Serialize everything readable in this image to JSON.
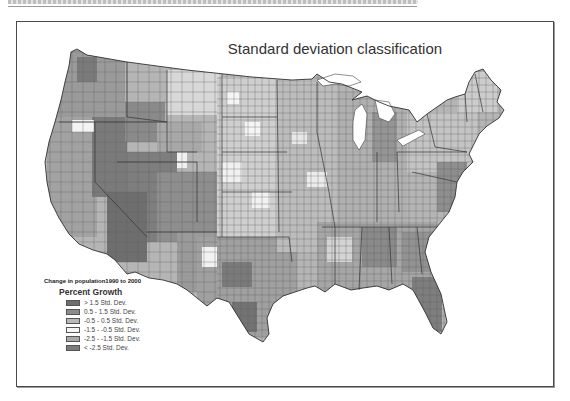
{
  "page": {
    "top_caption": "",
    "map_title": "Standard deviation classification"
  },
  "legend": {
    "caption": "Change in population1990 to 2000",
    "heading": "Percent Growth",
    "items": [
      {
        "label": "> 1.5 Std. Dev.",
        "color": "#6e6e6e"
      },
      {
        "label": "0.5 - 1.5 Std. Dev.",
        "color": "#8c8c8c"
      },
      {
        "label": "-0.5 - 0.5 Std. Dev.",
        "color": "#b9b9b9"
      },
      {
        "label": "-1.5 - -0.5 Std. Dev.",
        "color": "#f5f5f5"
      },
      {
        "label": "-2.5 - -1.5 Std. Dev.",
        "color": "#a9a9a9"
      },
      {
        "label": "< -2.5 Std. Dev.",
        "color": "#7c7c7c"
      }
    ]
  },
  "map": {
    "subject": "Contiguous United States counties",
    "classification": "Standard deviation",
    "state_border_color": "#3a3a3a",
    "county_border_color": "#555555"
  }
}
